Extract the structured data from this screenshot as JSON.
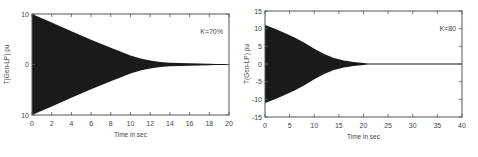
{
  "chart_data": [
    {
      "type": "line",
      "title": "",
      "xlabel": "Time in sec",
      "ylabel": "T(Gen-LP) pu",
      "legend": "K=70%",
      "xlim": [
        0,
        20
      ],
      "ylim": [
        -10,
        10
      ],
      "xticks": [
        0,
        2,
        4,
        6,
        8,
        10,
        12,
        14,
        16,
        18,
        20
      ],
      "yticks": [
        -10,
        0,
        10
      ],
      "ytick_labels": [
        "10",
        "0",
        "10"
      ],
      "grid": false,
      "series": [
        {
          "name": "Oscillation envelope (upper)",
          "x": [
            0,
            2,
            4,
            6,
            8,
            10,
            11,
            12,
            13,
            14,
            15,
            16,
            17,
            18,
            20
          ],
          "values": [
            10,
            8.3,
            6.6,
            4.9,
            3.3,
            1.8,
            1.2,
            0.8,
            0.5,
            0.35,
            0.3,
            0.25,
            0.2,
            0.15,
            0
          ]
        },
        {
          "name": "Oscillation envelope (lower)",
          "x": [
            0,
            2,
            4,
            6,
            8,
            10,
            11,
            12,
            13,
            14,
            15,
            16,
            17,
            18,
            20
          ],
          "values": [
            -10,
            -8.3,
            -6.6,
            -4.9,
            -3.3,
            -1.8,
            -1.2,
            -0.8,
            -0.5,
            -0.35,
            -0.3,
            -0.25,
            -0.2,
            -0.15,
            0
          ]
        }
      ]
    },
    {
      "type": "line",
      "title": "",
      "xlabel": "Time in sec",
      "ylabel": "T(Gen-LP) pu",
      "legend": "K=80",
      "xlim": [
        0,
        40
      ],
      "ylim": [
        -15,
        15
      ],
      "xticks": [
        0,
        5,
        10,
        15,
        20,
        25,
        30,
        35,
        40
      ],
      "yticks": [
        -15,
        -10,
        -5,
        0,
        5,
        10,
        15
      ],
      "ytick_labels": [
        "-15",
        "-10",
        "-5",
        "0",
        "5",
        "10",
        "15"
      ],
      "grid": false,
      "series": [
        {
          "name": "Oscillation envelope (upper)",
          "x": [
            0,
            2,
            4,
            6,
            8,
            10,
            12,
            14,
            16,
            18,
            20,
            21,
            40
          ],
          "values": [
            11,
            10,
            8.8,
            7.5,
            6,
            4.3,
            2.8,
            1.7,
            1.0,
            0.6,
            0.3,
            0,
            0
          ]
        },
        {
          "name": "Oscillation envelope (lower)",
          "x": [
            0,
            2,
            4,
            6,
            8,
            10,
            12,
            14,
            16,
            18,
            20,
            21,
            40
          ],
          "values": [
            -11,
            -10,
            -8.8,
            -7.5,
            -6,
            -4.3,
            -2.8,
            -1.7,
            -1.0,
            -0.6,
            -0.3,
            0,
            0
          ]
        }
      ]
    }
  ],
  "colors": {
    "fill": "#1a1a1a",
    "axis": "#555555",
    "text": "#444444",
    "background": "#ffffff"
  }
}
